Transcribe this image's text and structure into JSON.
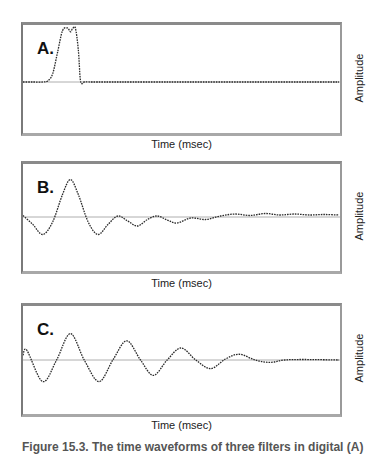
{
  "figure": {
    "caption_partial": "Figure 15.3. The time waveforms of three filters in digital (A)",
    "panels": [
      {
        "id": "A",
        "label": "A.",
        "xlabel": "Time (msec)",
        "ylabel": "Amplitude"
      },
      {
        "id": "B",
        "label": "B.",
        "xlabel": "Time (msec)",
        "ylabel": "Amplitude"
      },
      {
        "id": "C",
        "label": "C.",
        "xlabel": "Time (msec)",
        "ylabel": "Amplitude"
      }
    ]
  },
  "chart_data": [
    {
      "type": "line",
      "title": "A.",
      "xlabel": "Time (msec)",
      "ylabel": "Amplitude",
      "grid": false,
      "baseline": true,
      "description": "Short rectangular pulse near start, flat afterwards",
      "x": [
        0,
        10,
        20,
        25,
        30,
        35,
        40,
        45,
        48,
        50,
        53,
        56,
        58,
        60,
        62,
        70,
        100,
        150,
        200,
        250,
        300,
        320
      ],
      "y": [
        0,
        0,
        0,
        0.02,
        0.15,
        0.55,
        0.95,
        1.0,
        0.93,
        0.98,
        1.0,
        0.6,
        0.05,
        -0.03,
        0,
        0,
        0,
        0,
        0,
        0,
        0,
        0
      ],
      "ylim": [
        -1.05,
        1.05
      ]
    },
    {
      "type": "line",
      "title": "B.",
      "xlabel": "Time (msec)",
      "ylabel": "Amplitude",
      "grid": false,
      "baseline": true,
      "description": "Single large peak followed by rapidly decaying ringing",
      "x": [
        0,
        10,
        20,
        30,
        40,
        48,
        56,
        66,
        76,
        86,
        96,
        106,
        116,
        126,
        136,
        146,
        156,
        170,
        185,
        200,
        215,
        230,
        245,
        260,
        275,
        290,
        305,
        320
      ],
      "y": [
        0.03,
        -0.15,
        -0.35,
        -0.1,
        0.45,
        0.75,
        0.45,
        -0.1,
        -0.35,
        -0.15,
        0.02,
        -0.08,
        -0.18,
        -0.05,
        0.02,
        -0.06,
        -0.12,
        -0.02,
        -0.05,
        0.02,
        0.06,
        0.03,
        0.07,
        0.04,
        0.06,
        0.04,
        0.05,
        0.04
      ],
      "ylim": [
        -1.05,
        1.05
      ]
    },
    {
      "type": "line",
      "title": "C.",
      "xlabel": "Time (msec)",
      "ylabel": "Amplitude",
      "grid": false,
      "baseline": true,
      "description": "Damped sinusoidal oscillation decaying to zero",
      "x": [
        0,
        4,
        20,
        34,
        48,
        62,
        77,
        91,
        105,
        119,
        132,
        146,
        160,
        175,
        190,
        205,
        219,
        235,
        250,
        265,
        285,
        320
      ],
      "y": [
        0.1,
        0.2,
        -0.45,
        0.0,
        0.55,
        0.0,
        -0.45,
        0.0,
        0.4,
        0.0,
        -0.32,
        0.0,
        0.25,
        0.0,
        -0.18,
        0.02,
        0.12,
        0.0,
        -0.05,
        0.0,
        0.01,
        0.0
      ],
      "ylim": [
        -1.05,
        1.05
      ]
    }
  ]
}
